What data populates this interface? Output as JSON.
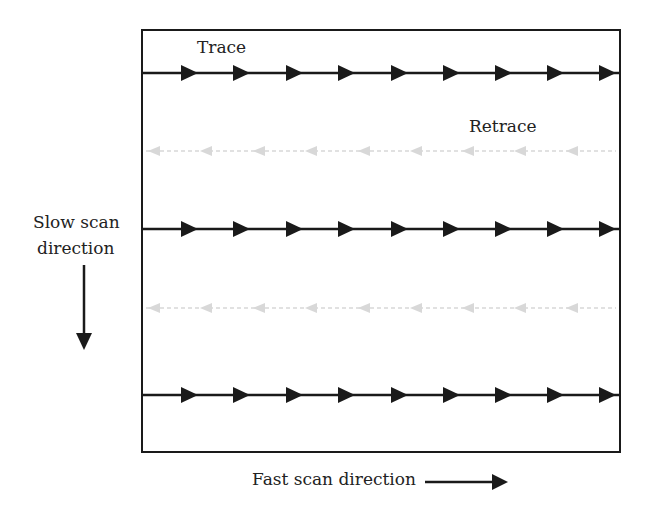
{
  "diagram": {
    "labels": {
      "trace": "Trace",
      "retrace": "Retrace",
      "slow_scan_line1": "Slow scan",
      "slow_scan_line2": "direction",
      "fast_scan": "Fast scan direction"
    },
    "frame": {
      "x": 142,
      "y": 30,
      "width": 478,
      "height": 422
    },
    "trace_lines_y": [
      73,
      229,
      395
    ],
    "retrace_lines_y": [
      151,
      308
    ],
    "arrow_x": [
      190,
      242,
      295,
      347,
      400,
      452,
      504,
      556,
      608
    ],
    "colors": {
      "line": "#1a1a1a",
      "retrace": "#d8d8d8"
    }
  }
}
